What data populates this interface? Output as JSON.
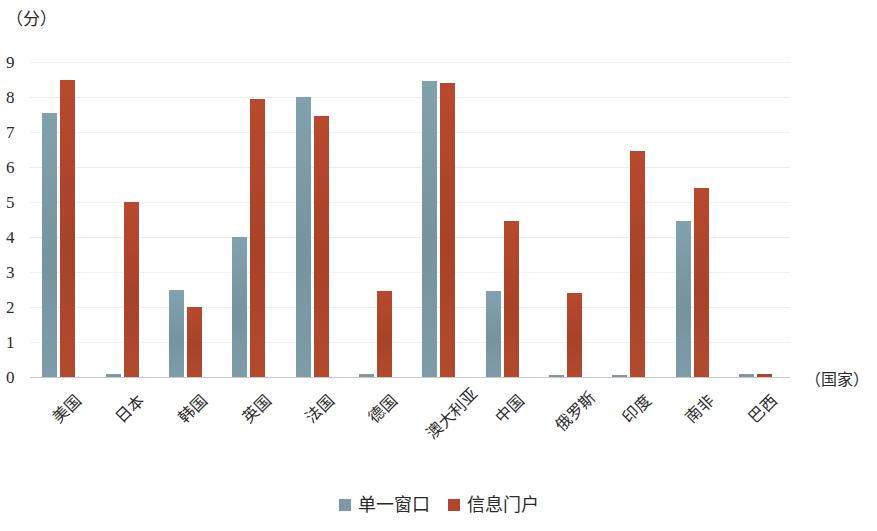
{
  "chart_data": {
    "type": "bar",
    "title": "",
    "subtitle": "",
    "xlabel": "（国家）",
    "ylabel": "（分）",
    "ylim": [
      0,
      9
    ],
    "yticks": [
      9,
      8,
      7,
      6,
      5,
      4,
      3,
      2,
      1,
      0
    ],
    "grid": true,
    "legend_position": "bottom-center",
    "categories": [
      "美国",
      "日本",
      "韩国",
      "英国",
      "法国",
      "德国",
      "澳大利亚",
      "中国",
      "俄罗斯",
      "印度",
      "南非",
      "巴西"
    ],
    "series": [
      {
        "name": "单一窗口",
        "color": "#7a9aa8",
        "values": [
          7.55,
          0.1,
          2.5,
          4.0,
          8.0,
          0.1,
          8.45,
          2.45,
          0.07,
          0.07,
          4.45,
          0.08
        ]
      },
      {
        "name": "信息门户",
        "color": "#b1462c",
        "values": [
          8.5,
          5.0,
          2.0,
          7.95,
          7.45,
          2.45,
          8.4,
          4.45,
          2.4,
          6.45,
          5.4,
          0.08
        ]
      }
    ]
  },
  "axes": {
    "y_unit_label": "（分）",
    "x_unit_label": "（国家）"
  },
  "legend": {
    "items": [
      {
        "label": "单一窗口",
        "color": "#7a9aa8"
      },
      {
        "label": "信息门户",
        "color": "#b1462c"
      }
    ]
  },
  "colors": {
    "series_0": "#7a9aa8",
    "series_1": "#b1462c",
    "gridline": "#e9eef1",
    "axis": "#c9c9c9",
    "text": "#2b2b2b",
    "background": "#ffffff"
  }
}
